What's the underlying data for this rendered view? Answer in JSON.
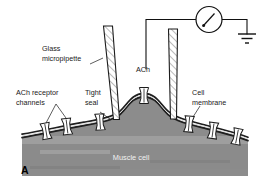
{
  "figure": {
    "panel_letter": "A",
    "background_color": "#ffffff",
    "cytoplasm_color": "#8c8c8c",
    "membrane_color": "#1f1f1f",
    "glass_color": "#ffffff",
    "hatch_color": "#555555",
    "ink_color": "#111111"
  },
  "labels": {
    "glass_micropipette": {
      "line1": "Glass",
      "line2": "micropipette"
    },
    "ach_receptor_channels": {
      "line1": "ACh receptor",
      "line2": "channels"
    },
    "tight_seal": {
      "line1": "Tight",
      "line2": "seal"
    },
    "cell_membrane": {
      "line1": "Cell",
      "line2": "membrane"
    },
    "ach": {
      "line1": "ACh"
    },
    "muscle_cell": {
      "line1": "Muscle cell"
    }
  },
  "components": {
    "meter": {
      "name": "galvanometer",
      "shape": "circle-with-needle"
    },
    "ground": {
      "name": "ground-symbol",
      "bars": 3
    },
    "pipettes": [
      {
        "id": "left-pipette",
        "name": "glass-micropipette-left",
        "fill": "hatched-glass"
      },
      {
        "id": "right-pipette",
        "name": "glass-micropipette-right",
        "fill": "hatched-glass"
      }
    ],
    "channels": [
      {
        "id": "ch1",
        "x": 46,
        "y": 131,
        "rot": -10
      },
      {
        "id": "ch2",
        "x": 67,
        "y": 126,
        "rot": -7
      },
      {
        "id": "ch3",
        "x": 100,
        "y": 122,
        "rot": -3
      },
      {
        "id": "ch4",
        "x": 144,
        "y": 97,
        "rot": 0
      },
      {
        "id": "ch5",
        "x": 189,
        "y": 124,
        "rot": 4
      },
      {
        "id": "ch6",
        "x": 213,
        "y": 131,
        "rot": 8
      },
      {
        "id": "ch7",
        "x": 237,
        "y": 137,
        "rot": 11
      }
    ]
  }
}
